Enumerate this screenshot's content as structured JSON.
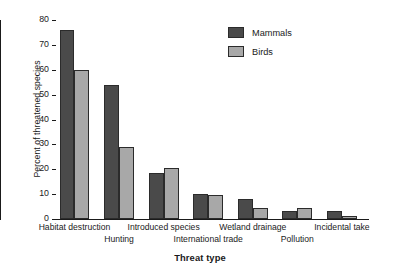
{
  "chart_data": {
    "type": "bar",
    "title": "",
    "xlabel": "Threat type",
    "ylabel": "Percent of threatened species",
    "ylim": [
      0,
      80
    ],
    "ytick_step": 10,
    "yticks": [
      0,
      10,
      20,
      30,
      40,
      50,
      60,
      70,
      80
    ],
    "grid": false,
    "legend_position": "top-right",
    "categories": [
      "Habitat destruction",
      "Hunting",
      "Introduced species",
      "International trade",
      "Wetland drainage",
      "Pollution",
      "Incidental take"
    ],
    "category_label_rows": [
      0,
      1,
      0,
      1,
      0,
      1,
      0
    ],
    "series": [
      {
        "name": "Mammals",
        "color": "#4a4a4a",
        "values": [
          76,
          54,
          18.5,
          10,
          8.2,
          3.2,
          3.2
        ]
      },
      {
        "name": "Birds",
        "color": "#a8a8a8",
        "values": [
          60,
          29,
          20.5,
          9.5,
          4.5,
          4.5,
          1.2
        ]
      }
    ]
  },
  "legend": {
    "items": [
      {
        "label": "Mammals",
        "color": "#4a4a4a"
      },
      {
        "label": "Birds",
        "color": "#a8a8a8"
      }
    ]
  },
  "axes": {
    "y_title": "Percent of threatened species",
    "x_title": "Threat type"
  },
  "colors": {
    "mammals": "#4a4a4a",
    "birds": "#a8a8a8",
    "axis": "#1a1a1a",
    "background": "#ffffff"
  }
}
